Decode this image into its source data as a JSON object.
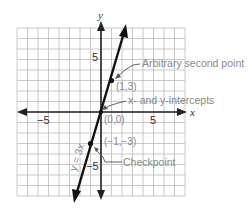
{
  "diagram": {
    "title": "",
    "axes": {
      "x_label": "x",
      "y_label": "y",
      "tick_labels": {
        "x_neg": "−5",
        "x_pos": "5",
        "y_pos": "5",
        "y_neg": "−5"
      }
    },
    "line": {
      "equation_label": "y = 3x",
      "color": "#111111"
    },
    "points": [
      {
        "coord_label": "(1,3)",
        "x": 1,
        "y": 3
      },
      {
        "coord_label": "(0,0)",
        "x": 0,
        "y": 0
      },
      {
        "coord_label": "(−1,−3)",
        "x": -1,
        "y": -3
      }
    ],
    "annotations": [
      {
        "text": "Arbitrary second point"
      },
      {
        "text": "x- and y-intercepts"
      },
      {
        "text": "Checkpoint"
      }
    ],
    "grid": {
      "min": -8,
      "max": 8,
      "color": "#bdbdbd"
    }
  },
  "chart_data": {
    "type": "line",
    "title": "",
    "xlabel": "x",
    "ylabel": "y",
    "xlim": [
      -8,
      8
    ],
    "ylim": [
      -8,
      8
    ],
    "grid": true,
    "series": [
      {
        "name": "y = 3x",
        "x": [
          -2.7,
          -1,
          0,
          1,
          2.4
        ],
        "values": [
          -8.2,
          -3,
          0,
          3,
          8.2
        ]
      }
    ],
    "marked_points": [
      {
        "label": "(1,3)",
        "x": 1,
        "y": 3,
        "annotation": "Arbitrary second point"
      },
      {
        "label": "(0,0)",
        "x": 0,
        "y": 0,
        "annotation": "x- and y-intercepts"
      },
      {
        "label": "(−1,−3)",
        "x": -1,
        "y": -3,
        "annotation": "Checkpoint"
      }
    ],
    "tick_labels": {
      "x": [
        "−5",
        "5"
      ],
      "y": [
        "5",
        "−5"
      ]
    }
  }
}
